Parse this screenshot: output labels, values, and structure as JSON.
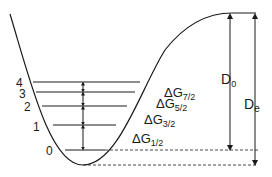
{
  "diagram": {
    "type": "morse-potential-energy-curve",
    "levels": [
      {
        "v": "0",
        "y": 150
      },
      {
        "v": "1",
        "y": 125
      },
      {
        "v": "2",
        "y": 106
      },
      {
        "v": "3",
        "y": 92
      },
      {
        "v": "4",
        "y": 82
      }
    ],
    "spacings": [
      {
        "base": "ΔG",
        "sub": "1/2"
      },
      {
        "base": "ΔG",
        "sub": "3/2"
      },
      {
        "base": "ΔG",
        "sub": "5/2"
      },
      {
        "base": "ΔG",
        "sub": "7/2"
      }
    ],
    "energies": {
      "d0": {
        "base": "D",
        "sub": "0"
      },
      "de": {
        "base": "D",
        "sub": "e"
      }
    },
    "colors": {
      "line": "#1a1a1a",
      "background": "#ffffff"
    }
  }
}
